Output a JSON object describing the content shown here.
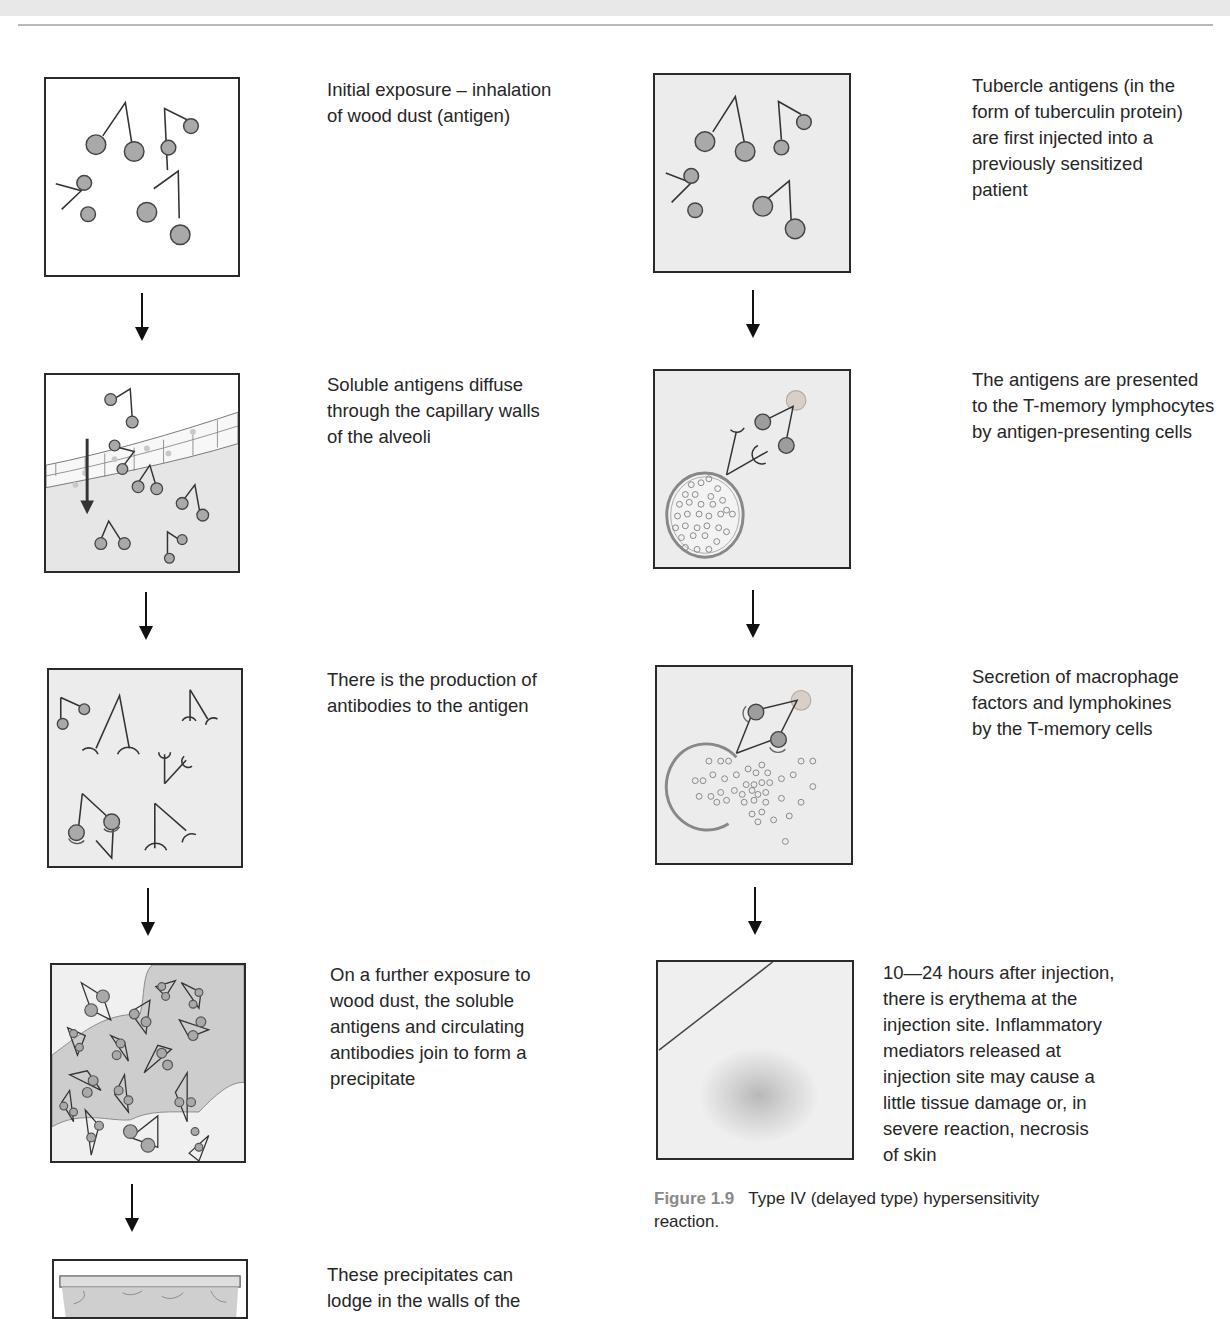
{
  "page": {
    "header_band": "",
    "left_column": {
      "title": "Type III (immune complex) hypersensitivity sequence",
      "steps": [
        {
          "caption": "Initial exposure – inhalation\nof wood dust (antigen)",
          "panel": "wood-dust-antigens"
        },
        {
          "caption": "Soluble antigens diffuse\nthrough the capillary walls\nof the alveoli",
          "panel": "capillary-diffusion"
        },
        {
          "caption": "There is the production of\nantibodies to the antigen",
          "panel": "antibody-production"
        },
        {
          "caption": "On a further exposure to\nwood dust, the soluble\nantigens and circulating\nantibodies join to form a\nprecipitate",
          "panel": "precipitate-formation"
        },
        {
          "caption": "These precipitates can\nlodge in the walls of the",
          "panel": "precipitate-lodging"
        }
      ]
    },
    "right_column": {
      "steps": [
        {
          "caption": "Tubercle antigens (in the\nform of tuberculin protein)\nare first injected into a\npreviously sensitized\npatient",
          "panel": "tubercle-antigens"
        },
        {
          "caption": "The antigens are presented\nto the T-memory lymphocytes\nby antigen-presenting cells",
          "panel": "antigen-presentation"
        },
        {
          "caption": "Secretion of macrophage\nfactors and lymphokines\nby the T-memory cells",
          "panel": "lymphokine-secretion"
        },
        {
          "caption": "10—24 hours after injection,\nthere is erythema at the\ninjection site. Inflammatory\nmediators released at\ninjection site may cause a\nlittle tissue damage or, in\nsevere reaction, necrosis\nof skin",
          "panel": "erythema"
        }
      ],
      "figure_caption": {
        "label": "Figure 1.9",
        "text": "Type IV (delayed type) hypersensitivity reaction."
      }
    },
    "colors": {
      "panel_border": "#2a2a2a",
      "panel_fill": "#ececec",
      "antigen_fill": "#a9a9a9",
      "figure_label": "#8a8a8a",
      "text": "#262626"
    },
    "icons": {
      "flow_arrow": "down-arrow-icon"
    }
  }
}
